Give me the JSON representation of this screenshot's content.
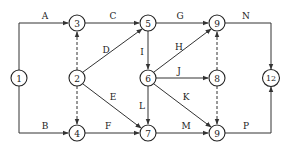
{
  "diagram": {
    "type": "activity-on-arrow network",
    "nodes": [
      {
        "id": "n1",
        "label": "1",
        "x": 19,
        "y": 78
      },
      {
        "id": "n2",
        "label": "2",
        "x": 77,
        "y": 78
      },
      {
        "id": "n3",
        "label": "3",
        "x": 77,
        "y": 23
      },
      {
        "id": "n4",
        "label": "4",
        "x": 77,
        "y": 133
      },
      {
        "id": "n5",
        "label": "5",
        "x": 148,
        "y": 23
      },
      {
        "id": "n6",
        "label": "6",
        "x": 148,
        "y": 78
      },
      {
        "id": "n7",
        "label": "7",
        "x": 148,
        "y": 133
      },
      {
        "id": "n8",
        "label": "8",
        "x": 217,
        "y": 78
      },
      {
        "id": "n9a",
        "label": "9",
        "x": 217,
        "y": 23
      },
      {
        "id": "n9b",
        "label": "9",
        "x": 217,
        "y": 133
      },
      {
        "id": "n12",
        "label": "12",
        "x": 271,
        "y": 78
      }
    ],
    "edges": [
      {
        "label": "A",
        "from": "1",
        "to": "3",
        "style": "solid"
      },
      {
        "label": "B",
        "from": "1",
        "to": "4",
        "style": "solid"
      },
      {
        "label": "C",
        "from": "3",
        "to": "5",
        "style": "solid"
      },
      {
        "label": "D",
        "from": "2",
        "to": "5",
        "style": "solid"
      },
      {
        "label": "E",
        "from": "2",
        "to": "7",
        "style": "solid"
      },
      {
        "label": "F",
        "from": "4",
        "to": "7",
        "style": "solid"
      },
      {
        "label": "G",
        "from": "5",
        "to": "9 (top)",
        "style": "solid"
      },
      {
        "label": "H",
        "from": "6",
        "to": "9 (top)",
        "style": "solid"
      },
      {
        "label": "I",
        "from": "5",
        "to": "6",
        "style": "solid"
      },
      {
        "label": "J",
        "from": "6",
        "to": "8",
        "style": "solid"
      },
      {
        "label": "K",
        "from": "6",
        "to": "9 (bottom)",
        "style": "solid"
      },
      {
        "label": "L",
        "from": "6",
        "to": "7",
        "style": "solid"
      },
      {
        "label": "M",
        "from": "7",
        "to": "9 (bottom)",
        "style": "solid"
      },
      {
        "label": "N",
        "from": "9 (top)",
        "to": "12",
        "style": "solid"
      },
      {
        "label": "P",
        "from": "9 (bottom)",
        "to": "12",
        "style": "solid"
      },
      {
        "label": "",
        "from": "2",
        "to": "3",
        "style": "dashed"
      },
      {
        "label": "",
        "from": "2",
        "to": "4",
        "style": "dashed"
      },
      {
        "label": "",
        "from": "8",
        "to": "9 (top)",
        "style": "dashed"
      },
      {
        "label": "",
        "from": "8",
        "to": "9 (bottom)",
        "style": "dashed"
      }
    ]
  },
  "labels": {
    "A": "A",
    "B": "B",
    "C": "C",
    "D": "D",
    "E": "E",
    "F": "F",
    "G": "G",
    "H": "H",
    "I": "I",
    "J": "J",
    "K": "K",
    "L": "L",
    "M": "M",
    "N": "N",
    "P": "P"
  },
  "node_labels": {
    "n1": "1",
    "n2": "2",
    "n3": "3",
    "n4": "4",
    "n5": "5",
    "n6": "6",
    "n7": "7",
    "n8": "8",
    "n9a": "9",
    "n9b": "9",
    "n12": "12"
  },
  "colors": {
    "stroke": "#222222",
    "background": "#ffffff"
  }
}
